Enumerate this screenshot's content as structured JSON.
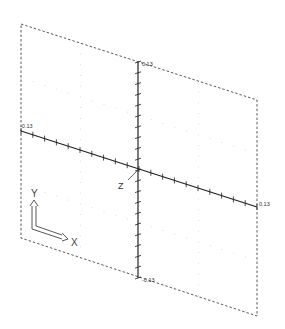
{
  "viewport": {
    "type": "isometric-3d-view",
    "frame": {
      "corners": [
        [
          21,
          24
        ],
        [
          257,
          100
        ],
        [
          257,
          316
        ],
        [
          21,
          238
        ]
      ],
      "style": "dashed",
      "color": "#333333"
    },
    "center": [
      138,
      170
    ],
    "grid_color": "#c8c8c8",
    "axis_color": "#222222"
  },
  "axes": {
    "y_axis": {
      "top_label": "0.13",
      "bottom_label": "-0.13",
      "ticks": 20
    },
    "x_axis": {
      "left_label": "-0.13",
      "right_label": "0.13",
      "ticks": 20
    },
    "z_label": "Z"
  },
  "ucs_icon": {
    "x_label": "X",
    "y_label": "Y"
  }
}
